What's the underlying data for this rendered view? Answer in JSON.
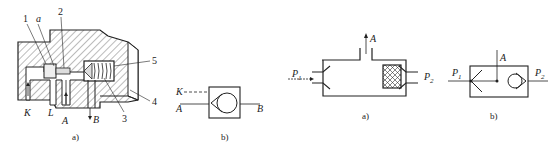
{
  "figure_left": {
    "subfig_a": {
      "caption": "a)",
      "part_numbers": [
        "1",
        "2",
        "3",
        "4",
        "5"
      ],
      "callout_a": "a",
      "port_labels": {
        "K": "K",
        "L": "L",
        "A": "A",
        "B": "B"
      }
    },
    "subfig_b": {
      "caption": "b)",
      "port_labels": {
        "K": "K",
        "A": "A",
        "B": "B"
      }
    }
  },
  "figure_right": {
    "subfig_a": {
      "caption": "a)",
      "port_labels": {
        "A": "A",
        "P1": "P",
        "P1_sub": "1",
        "P2": "P",
        "P2_sub": "2"
      }
    },
    "subfig_b": {
      "caption": "b)",
      "port_labels": {
        "A": "A",
        "P1": "P",
        "P1_sub": "1",
        "P2": "P",
        "P2_sub": "2"
      }
    }
  },
  "colors": {
    "line": "#222222",
    "hatch": "#555555",
    "background": "#ffffff"
  }
}
